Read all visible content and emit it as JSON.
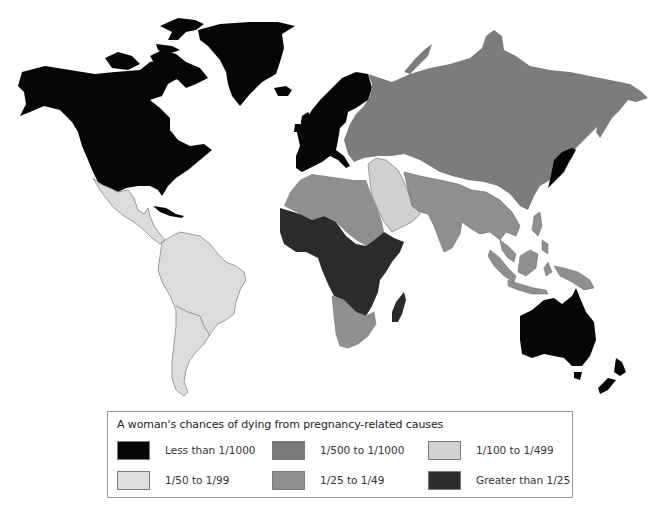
{
  "map": {
    "title": "World map of maternal mortality risk",
    "regions": [
      {
        "name": "North America",
        "category": "Less than 1/1000"
      },
      {
        "name": "Greenland",
        "category": "Less than 1/1000"
      },
      {
        "name": "Western Europe",
        "category": "Less than 1/1000"
      },
      {
        "name": "Japan",
        "category": "Less than 1/1000"
      },
      {
        "name": "Australia",
        "category": "Less than 1/1000"
      },
      {
        "name": "New Zealand",
        "category": "Less than 1/1000"
      },
      {
        "name": "Caribbean (Cuba)",
        "category": "Less than 1/1000"
      },
      {
        "name": "Russia / Eastern Europe / East Asia",
        "category": "1/500 to 1/1000"
      },
      {
        "name": "Middle East (Arabian Peninsula)",
        "category": "1/100 to 1/499"
      },
      {
        "name": "Central America and Mexico",
        "category": "1/50 to 1/99"
      },
      {
        "name": "South America",
        "category": "1/50 to 1/99"
      },
      {
        "name": "North Africa",
        "category": "1/25 to 1/49"
      },
      {
        "name": "Southern Africa",
        "category": "1/25 to 1/49"
      },
      {
        "name": "South Asia",
        "category": "1/25 to 1/49"
      },
      {
        "name": "Southeast Asia and Indonesia",
        "category": "1/25 to 1/49"
      },
      {
        "name": "Sub-Saharan Africa",
        "category": "Greater than 1/25"
      },
      {
        "name": "Madagascar",
        "category": "Greater than 1/25"
      }
    ]
  },
  "legend": {
    "title": "A woman's chances of dying from pregnancy-related causes",
    "items": [
      {
        "label": "Less than 1/1000",
        "color": "#050505"
      },
      {
        "label": "1/500 to 1/1000",
        "color": "#7a7a7a"
      },
      {
        "label": "1/100 to 1/499",
        "color": "#d2d2d2"
      },
      {
        "label": "1/50 to 1/99",
        "color": "#dedede"
      },
      {
        "label": "1/25 to 1/49",
        "color": "#8e8e8e"
      },
      {
        "label": "Greater than 1/25",
        "color": "#2c2c2c"
      }
    ]
  },
  "colors": {
    "cat1": "#050505",
    "cat2": "#7c7c7c",
    "cat3": "#d0d0d0",
    "cat4": "#dcdcdc",
    "cat5": "#8f8f8f",
    "cat6": "#2b2b2b"
  }
}
